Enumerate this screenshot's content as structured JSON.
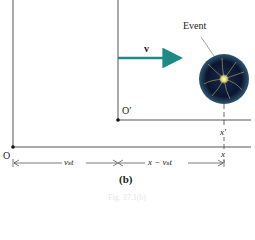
{
  "diagram": {
    "event_label": "Event",
    "velocity_label": "v",
    "origin_label": "O",
    "origin_prime_label": "O′",
    "x_prime_label": "x′",
    "x_label": "x",
    "dim_left_label": "vₛt",
    "dim_right_label": "x − vₛt",
    "panel_label": "(b)",
    "caption": "Fig. 37.1(b)"
  },
  "colors": {
    "arrow": "#1e8a86",
    "line": "#333333",
    "event_dark": "#0b1530",
    "event_glow": "#d8d070"
  }
}
